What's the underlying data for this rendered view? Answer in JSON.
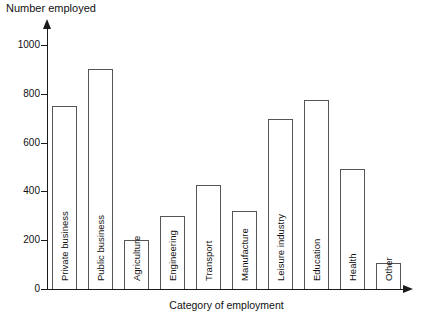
{
  "chart_data": {
    "type": "bar",
    "title": "",
    "ylabel": "Number employed",
    "xlabel": "Category of employment",
    "ylim": [
      0,
      1000
    ],
    "yticks": [
      "0",
      "200",
      "400",
      "600",
      "800",
      "1000"
    ],
    "grid": false,
    "legend": null,
    "categories": [
      "Private business",
      "Public business",
      "Agriculture",
      "Engineering",
      "Transport",
      "Manufacture",
      "Leisure industry",
      "Education",
      "Health",
      "Other"
    ],
    "values": [
      750,
      900,
      200,
      300,
      425,
      320,
      695,
      775,
      490,
      105
    ]
  },
  "style": {
    "bar_fill": "#ffffff",
    "bar_stroke": "#555555",
    "axis_color": "#1a1a1a",
    "text_color": "#111111"
  }
}
